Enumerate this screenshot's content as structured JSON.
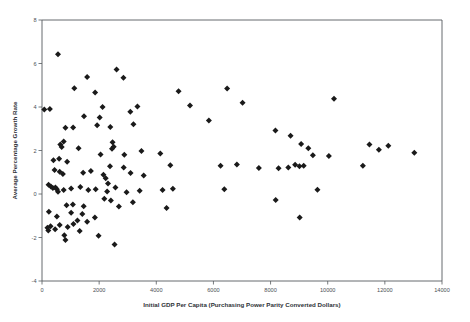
{
  "chart_data": {
    "type": "scatter",
    "title": "",
    "xlabel": "Initial GDP Per Capita (Purchasing Power Parity Converted Dollars)",
    "ylabel": "Average Percentage Growth Rate",
    "xlim": [
      0,
      14000
    ],
    "ylim": [
      -4,
      8
    ],
    "xticks": [
      0,
      2000,
      4000,
      6000,
      8000,
      10000,
      12000,
      14000
    ],
    "yticks": [
      -4,
      -2,
      0,
      2,
      4,
      6,
      8
    ],
    "xtick_labels": [
      "0",
      "2000",
      "4000",
      "6000",
      "8000",
      "10000",
      "12000",
      "14000"
    ],
    "ytick_labels": [
      "-4",
      "-2",
      "0",
      "2",
      "4",
      "6",
      "8"
    ],
    "grid": false,
    "legend": null,
    "marker": {
      "shape": "diamond",
      "color": "#1a1a1a",
      "size": 3
    },
    "series": [
      {
        "name": "Countries",
        "points": [
          [
            560,
            6.42
          ],
          [
            80,
            3.88
          ],
          [
            275,
            3.91
          ],
          [
            6480,
            4.85
          ],
          [
            2610,
            5.72
          ],
          [
            1580,
            5.38
          ],
          [
            2850,
            5.34
          ],
          [
            1130,
            4.86
          ],
          [
            1860,
            4.67
          ],
          [
            4780,
            4.72
          ],
          [
            7020,
            4.2
          ],
          [
            10220,
            4.38
          ],
          [
            5180,
            4.07
          ],
          [
            2120,
            4.0
          ],
          [
            3340,
            4.02
          ],
          [
            1470,
            3.58
          ],
          [
            3090,
            3.78
          ],
          [
            2020,
            3.52
          ],
          [
            5840,
            3.38
          ],
          [
            820,
            3.05
          ],
          [
            1090,
            3.06
          ],
          [
            1930,
            3.16
          ],
          [
            2390,
            3.08
          ],
          [
            3200,
            3.21
          ],
          [
            8170,
            2.92
          ],
          [
            11790,
            2.04
          ],
          [
            12120,
            2.22
          ],
          [
            640,
            2.28
          ],
          [
            760,
            2.41
          ],
          [
            690,
            2.16
          ],
          [
            2470,
            2.38
          ],
          [
            2510,
            2.17
          ],
          [
            2450,
            2.08
          ],
          [
            11460,
            2.28
          ],
          [
            13030,
            1.9
          ],
          [
            8700,
            2.68
          ],
          [
            1280,
            2.1
          ],
          [
            2050,
            1.82
          ],
          [
            2880,
            1.8
          ],
          [
            3480,
            1.98
          ],
          [
            4140,
            1.86
          ],
          [
            9070,
            2.3
          ],
          [
            9320,
            2.1
          ],
          [
            400,
            1.55
          ],
          [
            600,
            1.62
          ],
          [
            880,
            1.48
          ],
          [
            9480,
            1.78
          ],
          [
            10040,
            1.75
          ],
          [
            4490,
            1.32
          ],
          [
            2380,
            1.28
          ],
          [
            2860,
            1.22
          ],
          [
            6250,
            1.3
          ],
          [
            6820,
            1.36
          ],
          [
            440,
            1.1
          ],
          [
            620,
            1.02
          ],
          [
            730,
            0.92
          ],
          [
            1440,
            0.98
          ],
          [
            1710,
            1.06
          ],
          [
            2150,
            0.88
          ],
          [
            8860,
            1.35
          ],
          [
            9010,
            1.28
          ],
          [
            9160,
            1.3
          ],
          [
            8620,
            1.22
          ],
          [
            8280,
            1.18
          ],
          [
            2230,
            0.72
          ],
          [
            2310,
            0.48
          ],
          [
            3100,
            0.96
          ],
          [
            3560,
            0.85
          ],
          [
            7590,
            1.2
          ],
          [
            11230,
            1.3
          ],
          [
            230,
            0.42
          ],
          [
            310,
            0.35
          ],
          [
            380,
            0.28
          ],
          [
            470,
            0.3
          ],
          [
            520,
            0.22
          ],
          [
            560,
            0.1
          ],
          [
            760,
            0.18
          ],
          [
            1020,
            0.25
          ],
          [
            1340,
            0.32
          ],
          [
            1620,
            0.18
          ],
          [
            1880,
            0.22
          ],
          [
            2280,
            0.12
          ],
          [
            2570,
            0.3
          ],
          [
            2960,
            0.08
          ],
          [
            3420,
            0.15
          ],
          [
            4220,
            0.18
          ],
          [
            4580,
            0.24
          ],
          [
            6380,
            0.22
          ],
          [
            9640,
            0.2
          ],
          [
            2180,
            -0.22
          ],
          [
            2410,
            -0.3
          ],
          [
            3180,
            -0.38
          ],
          [
            860,
            -0.52
          ],
          [
            1080,
            -0.48
          ],
          [
            1460,
            -0.56
          ],
          [
            8180,
            -0.28
          ],
          [
            2690,
            -0.58
          ],
          [
            4360,
            -0.64
          ],
          [
            240,
            -0.82
          ],
          [
            1020,
            -0.86
          ],
          [
            1410,
            -0.92
          ],
          [
            1850,
            -1.08
          ],
          [
            520,
            -1.04
          ],
          [
            1240,
            -1.22
          ],
          [
            9020,
            -1.08
          ],
          [
            300,
            -1.48
          ],
          [
            620,
            -1.42
          ],
          [
            900,
            -1.52
          ],
          [
            1100,
            -1.38
          ],
          [
            1580,
            -1.28
          ],
          [
            220,
            -1.68
          ],
          [
            780,
            -1.9
          ],
          [
            820,
            -2.12
          ],
          [
            1980,
            -1.92
          ],
          [
            2540,
            -2.32
          ],
          [
            190,
            -1.55
          ],
          [
            460,
            -1.62
          ],
          [
            1320,
            -1.7
          ]
        ]
      }
    ]
  },
  "figure": {
    "background_color": "#ffffff",
    "axis_color": "#555a5e",
    "marker_color": "#1a1a1a"
  }
}
